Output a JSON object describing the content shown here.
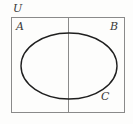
{
  "figure": {
    "kind": "venn-set-diagram",
    "width": 133,
    "height": 124,
    "background_color": "#fdfdfc"
  },
  "labels": {
    "universe": "U",
    "region_left": "A",
    "region_right": "B",
    "ellipse": "C"
  },
  "shapes": {
    "universe_rect": {
      "name": "universal-set-rectangle",
      "x": 11,
      "y": 17,
      "width": 114,
      "height": 96,
      "stroke": "#8a8a8a",
      "stroke_width": 1,
      "fill": "none"
    },
    "divider_line": {
      "name": "vertical-divider",
      "x1": 68,
      "y1": 17,
      "x2": 68,
      "y2": 113,
      "stroke": "#8a8a8a",
      "stroke_width": 1
    },
    "ellipse": {
      "name": "set-c-ellipse",
      "cx": 69,
      "cy": 66,
      "rx": 48,
      "ry": 33,
      "stroke": "#1f1f1f",
      "stroke_width": 1.4,
      "fill": "none"
    }
  }
}
